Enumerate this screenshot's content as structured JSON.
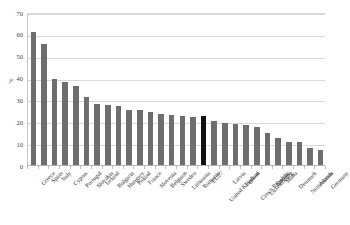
{
  "chart_data": {
    "type": "bar",
    "title": "",
    "subtitle": "",
    "xlabel": "",
    "ylabel": "%",
    "ylim": [
      0,
      70
    ],
    "yticks": [
      0,
      10,
      20,
      30,
      40,
      50,
      60,
      70
    ],
    "grid": true,
    "legend": false,
    "legend_position": "none",
    "orientation": "vertical",
    "sorted": "descending",
    "highlight_category": "EU27",
    "colors": {
      "bar": "#6e6e6e",
      "highlight_bar": "#101010",
      "gridline": "#d9d9d9",
      "axis": "#b4b4b4",
      "background": "#ffffff",
      "text": "#2f2f2f"
    },
    "categories": [
      "Greece",
      "Spain",
      "Italy",
      "Cyprus",
      "Portugal",
      "Slovakia",
      "Ireland",
      "Bulgaria",
      "Hungary",
      "Poland",
      "France",
      "Slovenia",
      "Belgium",
      "Sweden",
      "Lithuania",
      "Romania",
      "EU27",
      "United Kingdom",
      "Latvia",
      "Finland",
      "Czech Republic",
      "Luxembourg",
      "Estonia",
      "Malta",
      "Denmark",
      "Netherlands",
      "Austria",
      "Germany"
    ],
    "values": [
      61.5,
      55.9,
      40.0,
      38.5,
      36.6,
      31.5,
      28.4,
      28.0,
      27.3,
      25.8,
      25.4,
      24.8,
      23.7,
      23.4,
      22.8,
      22.6,
      22.7,
      20.8,
      19.5,
      19.3,
      18.6,
      18.0,
      15.3,
      12.8,
      11.0,
      10.9,
      8.3,
      7.3
    ]
  }
}
